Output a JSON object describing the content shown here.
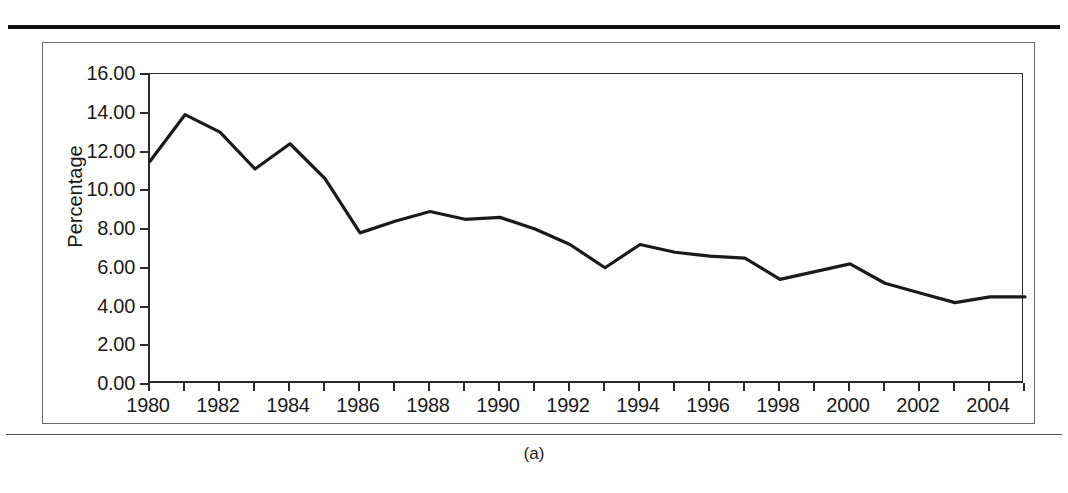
{
  "figure": {
    "caption": "(a)",
    "line_color": "#1a1a1a",
    "axis_color": "#2b2b2b",
    "frame_color": "#6a6a6a"
  },
  "chart_data": {
    "type": "line",
    "title": "",
    "xlabel": "",
    "ylabel": "Percentage",
    "xlim": [
      1980,
      2005
    ],
    "ylim": [
      0,
      16
    ],
    "grid": false,
    "legend": null,
    "y_ticks": [
      "0.00",
      "2.00",
      "4.00",
      "6.00",
      "8.00",
      "10.00",
      "12.00",
      "14.00",
      "16.00"
    ],
    "y_tick_values": [
      0,
      2,
      4,
      6,
      8,
      10,
      12,
      14,
      16
    ],
    "x_tick_values": [
      1980,
      1981,
      1982,
      1983,
      1984,
      1985,
      1986,
      1987,
      1988,
      1989,
      1990,
      1991,
      1992,
      1993,
      1994,
      1995,
      1996,
      1997,
      1998,
      1999,
      2000,
      2001,
      2002,
      2003,
      2004,
      2005
    ],
    "x_tick_labels": [
      "1980",
      "",
      "1982",
      "",
      "1984",
      "",
      "1986",
      "",
      "1988",
      "",
      "1990",
      "",
      "1992",
      "",
      "1994",
      "",
      "1996",
      "",
      "1998",
      "",
      "2000",
      "",
      "2002",
      "",
      "2004",
      ""
    ],
    "x": [
      1980,
      1981,
      1982,
      1983,
      1984,
      1985,
      1986,
      1987,
      1988,
      1989,
      1990,
      1991,
      1992,
      1993,
      1994,
      1995,
      1996,
      1997,
      1998,
      1999,
      2000,
      2001,
      2002,
      2003,
      2004,
      2005
    ],
    "values": [
      11.5,
      13.9,
      13.0,
      11.1,
      12.4,
      10.6,
      7.8,
      8.4,
      8.9,
      8.5,
      8.6,
      8.0,
      7.2,
      6.0,
      7.2,
      6.8,
      6.6,
      6.5,
      5.4,
      5.8,
      6.2,
      5.2,
      4.7,
      4.2,
      4.5,
      4.5
    ]
  }
}
